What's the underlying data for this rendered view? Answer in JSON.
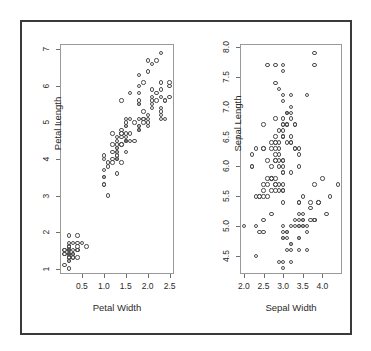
{
  "figure": {
    "background_color": "#ffffff",
    "frame_color": "#3a3a3a",
    "panel_count": 2,
    "marker_color": "#4d4d4d",
    "axis_color": "#9a9a9a"
  },
  "chart_data": [
    {
      "type": "scatter",
      "title": "",
      "xlabel": "Petal Width",
      "ylabel": "Petal Length",
      "xlim": [
        0.0,
        2.6
      ],
      "ylim": [
        0.85,
        7.15
      ],
      "grid": false,
      "legend": "none",
      "marker": "open-circle",
      "xticks": [
        "0.5",
        "1.0",
        "1.5",
        "2.0",
        "2.5"
      ],
      "xtickvalues": [
        0.5,
        1.0,
        1.5,
        2.0,
        2.5
      ],
      "yticks": [
        "1",
        "2",
        "3",
        "4",
        "5",
        "6",
        "7"
      ],
      "ytickvalues": [
        1,
        2,
        3,
        4,
        5,
        6,
        7
      ],
      "x": [
        0.2,
        0.2,
        0.2,
        0.2,
        0.2,
        0.4,
        0.3,
        0.2,
        0.2,
        0.1,
        0.2,
        0.2,
        0.1,
        0.1,
        0.2,
        0.4,
        0.4,
        0.3,
        0.3,
        0.3,
        0.2,
        0.4,
        0.2,
        0.5,
        0.2,
        0.2,
        0.4,
        0.2,
        0.2,
        0.2,
        0.2,
        0.4,
        0.1,
        0.2,
        0.2,
        0.2,
        0.2,
        0.1,
        0.2,
        0.2,
        0.3,
        0.3,
        0.2,
        0.6,
        0.4,
        0.3,
        0.2,
        0.2,
        0.2,
        0.2,
        1.4,
        1.5,
        1.5,
        1.3,
        1.5,
        1.3,
        1.6,
        1.0,
        1.3,
        1.4,
        1.0,
        1.5,
        1.0,
        1.4,
        1.3,
        1.4,
        1.5,
        1.0,
        1.5,
        1.1,
        1.8,
        1.3,
        1.5,
        1.2,
        1.3,
        1.4,
        1.4,
        1.7,
        1.5,
        1.0,
        1.1,
        1.0,
        1.2,
        1.6,
        1.5,
        1.6,
        1.5,
        1.3,
        1.3,
        1.3,
        1.2,
        1.4,
        1.2,
        1.0,
        1.3,
        1.2,
        1.3,
        1.3,
        1.1,
        1.3,
        2.5,
        1.9,
        2.1,
        1.8,
        2.2,
        2.1,
        1.7,
        1.8,
        1.8,
        2.5,
        2.0,
        1.9,
        2.1,
        2.0,
        2.4,
        2.3,
        1.8,
        2.2,
        2.3,
        1.5,
        2.3,
        2.0,
        2.0,
        1.8,
        2.1,
        1.8,
        1.8,
        1.8,
        2.1,
        1.6,
        1.9,
        2.0,
        2.2,
        1.5,
        1.4,
        2.3,
        2.4,
        1.8,
        1.8,
        2.1,
        2.4,
        2.3,
        1.9,
        2.3,
        2.5,
        2.3,
        1.9,
        2.0,
        2.3,
        1.8
      ],
      "y": [
        1.4,
        1.4,
        1.3,
        1.5,
        1.4,
        1.7,
        1.4,
        1.5,
        1.4,
        1.5,
        1.5,
        1.6,
        1.4,
        1.1,
        1.2,
        1.5,
        1.3,
        1.4,
        1.7,
        1.5,
        1.7,
        1.5,
        1.0,
        1.7,
        1.9,
        1.6,
        1.6,
        1.5,
        1.4,
        1.6,
        1.6,
        1.5,
        1.5,
        1.4,
        1.5,
        1.2,
        1.3,
        1.4,
        1.3,
        1.5,
        1.3,
        1.3,
        1.3,
        1.6,
        1.9,
        1.4,
        1.6,
        1.4,
        1.5,
        1.4,
        4.7,
        4.5,
        4.9,
        4.0,
        4.6,
        4.5,
        4.7,
        3.3,
        4.6,
        3.9,
        3.5,
        4.2,
        4.0,
        4.7,
        3.6,
        4.4,
        4.5,
        4.1,
        4.5,
        3.9,
        4.8,
        4.0,
        4.9,
        4.7,
        4.3,
        4.4,
        4.8,
        5.0,
        4.5,
        3.5,
        3.8,
        3.7,
        3.9,
        5.1,
        4.5,
        4.5,
        4.7,
        4.4,
        4.1,
        4.0,
        4.4,
        4.6,
        4.0,
        3.3,
        4.2,
        4.2,
        4.2,
        4.3,
        3.0,
        4.1,
        6.0,
        5.1,
        5.9,
        5.6,
        5.8,
        6.6,
        4.5,
        6.3,
        5.8,
        6.1,
        5.1,
        5.3,
        5.5,
        5.0,
        5.1,
        5.3,
        5.5,
        6.7,
        6.9,
        5.0,
        5.7,
        4.9,
        6.7,
        4.9,
        5.7,
        6.0,
        4.8,
        4.9,
        5.6,
        5.8,
        6.1,
        6.4,
        5.6,
        5.1,
        5.6,
        6.1,
        5.6,
        5.5,
        4.8,
        5.4,
        5.6,
        5.1,
        5.1,
        5.9,
        5.7,
        5.2,
        5.0,
        5.2,
        5.4,
        5.1
      ]
    },
    {
      "type": "scatter",
      "title": "",
      "xlabel": "Sepal Width",
      "ylabel": "Sepal Length",
      "xlim": [
        1.9,
        4.5
      ],
      "ylim": [
        4.2,
        8.05
      ],
      "grid": false,
      "legend": "none",
      "marker": "open-circle",
      "xticks": [
        "2.0",
        "2.5",
        "3.0",
        "3.5",
        "4.0"
      ],
      "xtickvalues": [
        2.0,
        2.5,
        3.0,
        3.5,
        4.0
      ],
      "yticks": [
        "4.5",
        "5.0",
        "5.5",
        "6.0",
        "6.5",
        "7.0",
        "7.5",
        "8.0"
      ],
      "ytickvalues": [
        4.5,
        5.0,
        5.5,
        6.0,
        6.5,
        7.0,
        7.5,
        8.0
      ],
      "x": [
        3.5,
        3.0,
        3.2,
        3.1,
        3.6,
        3.9,
        3.4,
        3.4,
        2.9,
        3.1,
        3.7,
        3.4,
        3.0,
        3.0,
        4.0,
        4.4,
        3.9,
        3.5,
        3.8,
        3.8,
        3.4,
        3.7,
        3.6,
        3.3,
        3.4,
        3.0,
        3.4,
        3.5,
        3.4,
        3.2,
        3.1,
        3.4,
        4.1,
        4.2,
        3.1,
        3.2,
        3.5,
        3.6,
        3.0,
        3.4,
        3.5,
        2.3,
        3.2,
        3.5,
        3.8,
        3.0,
        3.8,
        3.2,
        3.7,
        3.3,
        3.2,
        3.2,
        3.1,
        2.3,
        2.8,
        2.8,
        3.3,
        2.4,
        2.9,
        2.7,
        2.0,
        3.0,
        2.2,
        2.9,
        2.9,
        3.1,
        3.0,
        2.7,
        2.2,
        2.5,
        3.2,
        2.8,
        2.5,
        2.8,
        2.9,
        3.0,
        2.8,
        3.0,
        2.9,
        2.6,
        2.4,
        2.4,
        2.7,
        2.7,
        3.0,
        3.4,
        3.1,
        2.3,
        3.0,
        2.5,
        2.6,
        3.0,
        2.6,
        2.3,
        2.7,
        3.0,
        2.9,
        2.9,
        2.5,
        2.8,
        3.3,
        2.7,
        3.0,
        2.9,
        3.0,
        3.0,
        2.5,
        2.9,
        2.5,
        3.6,
        3.2,
        2.7,
        3.0,
        2.5,
        2.8,
        3.2,
        3.0,
        3.8,
        2.6,
        2.2,
        3.2,
        2.8,
        2.8,
        2.7,
        3.3,
        3.2,
        2.8,
        3.0,
        2.8,
        3.0,
        2.8,
        3.8,
        2.8,
        2.8,
        2.6,
        3.0,
        3.4,
        3.1,
        3.0,
        3.1,
        3.1,
        3.1,
        2.7,
        3.2,
        3.3,
        3.0,
        2.5,
        3.0,
        3.4,
        3.0
      ],
      "y": [
        5.1,
        4.9,
        4.7,
        4.6,
        5.0,
        5.4,
        4.6,
        5.0,
        4.4,
        4.9,
        5.4,
        4.8,
        4.8,
        4.3,
        5.8,
        5.7,
        5.4,
        5.1,
        5.7,
        5.1,
        5.4,
        5.1,
        4.6,
        5.1,
        4.8,
        5.0,
        5.0,
        5.2,
        5.2,
        4.7,
        4.8,
        5.4,
        5.2,
        5.5,
        4.9,
        5.0,
        5.5,
        4.9,
        4.4,
        5.1,
        5.0,
        4.5,
        4.4,
        5.0,
        5.1,
        4.8,
        5.1,
        4.6,
        5.3,
        5.0,
        7.0,
        6.4,
        6.9,
        5.5,
        6.5,
        5.7,
        6.3,
        4.9,
        6.6,
        5.2,
        5.0,
        5.9,
        6.0,
        6.1,
        5.6,
        6.7,
        5.6,
        5.8,
        6.2,
        5.6,
        5.9,
        6.1,
        6.3,
        6.1,
        6.4,
        6.6,
        6.8,
        6.7,
        6.0,
        5.7,
        5.5,
        5.5,
        5.8,
        6.0,
        5.4,
        6.0,
        6.7,
        6.3,
        5.6,
        5.5,
        5.5,
        6.1,
        5.8,
        5.0,
        5.6,
        5.7,
        5.7,
        6.2,
        5.1,
        5.7,
        6.3,
        5.8,
        7.1,
        6.3,
        6.5,
        7.6,
        4.9,
        7.3,
        6.7,
        7.2,
        6.5,
        6.4,
        6.8,
        5.7,
        5.8,
        6.4,
        6.5,
        7.7,
        7.7,
        6.0,
        6.9,
        5.6,
        7.7,
        6.3,
        6.7,
        7.2,
        6.2,
        6.1,
        6.4,
        7.2,
        7.4,
        7.9,
        6.4,
        6.3,
        6.1,
        7.7,
        6.3,
        6.4,
        6.0,
        6.9,
        6.7,
        6.9,
        5.8,
        6.8,
        6.7,
        6.7,
        6.3,
        6.5,
        6.2,
        5.9
      ]
    }
  ]
}
